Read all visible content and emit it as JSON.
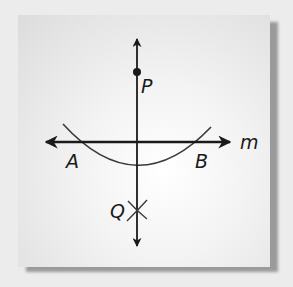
{
  "diagram": {
    "points": {
      "P": {
        "label": "P"
      },
      "Q": {
        "label": "Q"
      },
      "A": {
        "label": "A"
      },
      "B": {
        "label": "B"
      }
    },
    "lines": {
      "m": {
        "label": "m"
      }
    },
    "colors": {
      "ink": "#1a1a1a",
      "arc": "#3a3a3a",
      "paper": "#f3f3f3",
      "shadow": "#9a9a9a",
      "background": "#ececec"
    }
  }
}
